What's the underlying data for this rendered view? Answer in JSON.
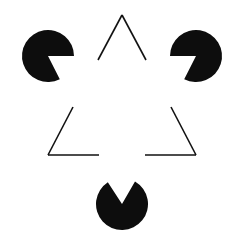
{
  "figure": {
    "name": "Kanizsa Triangle",
    "type": "illusory-contour-figure",
    "canvas": {
      "width": 243,
      "height": 244,
      "background_color": "#ffffff",
      "ink_color": "#0d0d0d"
    },
    "outline_triangle": {
      "label": "outline-triangle",
      "stroke_color": "#111111",
      "stroke_width": 1.6,
      "fill": "none",
      "orientation": "apex-up",
      "vertices": [
        {
          "name": "apex-top",
          "x": 122,
          "y": 15
        },
        {
          "name": "corner-bottom-left",
          "x": 48,
          "y": 155
        },
        {
          "name": "corner-bottom-right",
          "x": 196,
          "y": 155
        }
      ],
      "segments": [
        {
          "name": "left-edge-upper",
          "x1": 122,
          "y1": 15,
          "x2": 98,
          "y2": 60
        },
        {
          "name": "left-edge-lower",
          "x1": 73,
          "y1": 107,
          "x2": 48,
          "y2": 155
        },
        {
          "name": "right-edge-upper",
          "x1": 122,
          "y1": 15,
          "x2": 146,
          "y2": 60
        },
        {
          "name": "right-edge-lower",
          "x1": 171,
          "y1": 107,
          "x2": 196,
          "y2": 155
        },
        {
          "name": "bottom-edge-left",
          "x1": 48,
          "y1": 155,
          "x2": 99,
          "y2": 155
        },
        {
          "name": "bottom-edge-right",
          "x1": 145,
          "y1": 155,
          "x2": 196,
          "y2": 155
        }
      ]
    },
    "illusory_triangle": {
      "label": "illusory-triangle",
      "orientation": "apex-down",
      "vertices": [
        {
          "name": "illusory-corner-top-left",
          "x": 48,
          "y": 56
        },
        {
          "name": "illusory-corner-top-right",
          "x": 196,
          "y": 56
        },
        {
          "name": "illusory-corner-bottom",
          "x": 122,
          "y": 204
        }
      ]
    },
    "pacman_discs": [
      {
        "name": "pacman-top-left",
        "cx": 48,
        "cy": 56,
        "r": 26,
        "color": "#0d0d0d",
        "wedge_start_deg": 0,
        "wedge_end_deg": 63,
        "wedge_points_toward": "center"
      },
      {
        "name": "pacman-top-right",
        "cx": 196,
        "cy": 56,
        "r": 26,
        "color": "#0d0d0d",
        "wedge_start_deg": 117,
        "wedge_end_deg": 180,
        "wedge_points_toward": "center"
      },
      {
        "name": "pacman-bottom",
        "cx": 122,
        "cy": 204,
        "r": 26,
        "color": "#0d0d0d",
        "wedge_start_deg": 237,
        "wedge_end_deg": 300,
        "wedge_points_toward": "center"
      }
    ]
  }
}
